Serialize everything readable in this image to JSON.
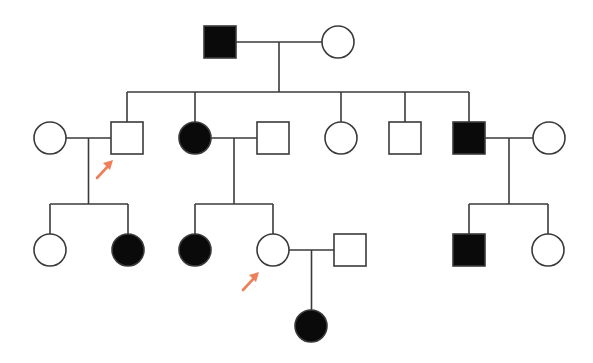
{
  "colors": {
    "line": "#3a3a3a",
    "affected": "#0a0a0a",
    "unaffected": "#ffffff",
    "arrow": "#ef7f5a"
  },
  "legend": {
    "square": "male",
    "circle": "female",
    "filled": "affected",
    "open": "unaffected",
    "arrow": "proband"
  },
  "individuals": [
    {
      "id": "I-1",
      "generation": 1,
      "sex": "male",
      "affected": true,
      "x": 220,
      "y": 42
    },
    {
      "id": "I-2",
      "generation": 1,
      "sex": "female",
      "affected": false,
      "x": 338,
      "y": 42
    },
    {
      "id": "II-1",
      "generation": 2,
      "sex": "female",
      "affected": false,
      "x": 50,
      "y": 138,
      "spouse_of": "II-2"
    },
    {
      "id": "II-2",
      "generation": 2,
      "sex": "male",
      "affected": false,
      "x": 127,
      "y": 138,
      "proband": true
    },
    {
      "id": "II-3",
      "generation": 2,
      "sex": "female",
      "affected": true,
      "x": 195,
      "y": 138
    },
    {
      "id": "II-4",
      "generation": 2,
      "sex": "male",
      "affected": false,
      "x": 273,
      "y": 138,
      "spouse_of": "II-3"
    },
    {
      "id": "II-5",
      "generation": 2,
      "sex": "female",
      "affected": false,
      "x": 341,
      "y": 138
    },
    {
      "id": "II-6",
      "generation": 2,
      "sex": "male",
      "affected": false,
      "x": 405,
      "y": 138
    },
    {
      "id": "II-7",
      "generation": 2,
      "sex": "male",
      "affected": true,
      "x": 469,
      "y": 138
    },
    {
      "id": "II-8",
      "generation": 2,
      "sex": "female",
      "affected": false,
      "x": 549,
      "y": 138,
      "spouse_of": "II-7"
    },
    {
      "id": "III-1",
      "generation": 3,
      "sex": "female",
      "affected": false,
      "x": 50,
      "y": 250
    },
    {
      "id": "III-2",
      "generation": 3,
      "sex": "female",
      "affected": true,
      "x": 128,
      "y": 250
    },
    {
      "id": "III-3",
      "generation": 3,
      "sex": "female",
      "affected": true,
      "x": 195,
      "y": 250
    },
    {
      "id": "III-4",
      "generation": 3,
      "sex": "female",
      "affected": false,
      "x": 273,
      "y": 250,
      "proband": true
    },
    {
      "id": "III-5",
      "generation": 3,
      "sex": "male",
      "affected": false,
      "x": 350,
      "y": 250,
      "spouse_of": "III-4"
    },
    {
      "id": "III-6",
      "generation": 3,
      "sex": "male",
      "affected": true,
      "x": 469,
      "y": 250
    },
    {
      "id": "III-7",
      "generation": 3,
      "sex": "female",
      "affected": false,
      "x": 548,
      "y": 250
    },
    {
      "id": "IV-1",
      "generation": 4,
      "sex": "female",
      "affected": true,
      "x": 311,
      "y": 326
    }
  ],
  "families": [
    {
      "parents": [
        "I-1",
        "I-2"
      ],
      "children": [
        "II-2",
        "II-3",
        "II-5",
        "II-6",
        "II-7"
      ]
    },
    {
      "parents": [
        "II-1",
        "II-2"
      ],
      "children": [
        "III-1",
        "III-2"
      ]
    },
    {
      "parents": [
        "II-3",
        "II-4"
      ],
      "children": [
        "III-3",
        "III-4"
      ]
    },
    {
      "parents": [
        "II-7",
        "II-8"
      ],
      "children": [
        "III-6",
        "III-7"
      ]
    },
    {
      "parents": [
        "III-4",
        "III-5"
      ],
      "children": [
        "IV-1"
      ]
    }
  ]
}
